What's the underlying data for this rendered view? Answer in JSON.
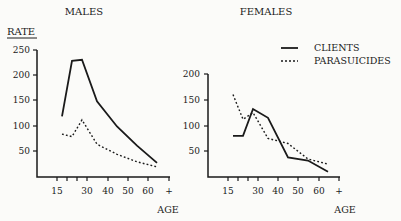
{
  "chart_data": [
    {
      "type": "line",
      "title": "MALES",
      "xlabel": "AGE",
      "ylabel": "RATE",
      "x_tick_labels": [
        "15",
        "30",
        "40",
        "50",
        "60",
        "+"
      ],
      "y_tick_labels": [
        "50",
        "100",
        "150",
        "200",
        "250"
      ],
      "ylim": [
        0,
        250
      ],
      "grid": false,
      "x": [
        17.5,
        22.5,
        27.5,
        35,
        45,
        55,
        65
      ],
      "series": [
        {
          "name": "CLIENTS",
          "style": "solid",
          "values": [
            120,
            230,
            232,
            150,
            100,
            62,
            28
          ]
        },
        {
          "name": "PARASUICIDES",
          "style": "dotted",
          "values": [
            85,
            80,
            113,
            65,
            45,
            30,
            20
          ]
        }
      ]
    },
    {
      "type": "line",
      "title": "FEMALES",
      "xlabel": "AGE",
      "ylabel": "",
      "x_tick_labels": [
        "15",
        "30",
        "40",
        "50",
        "60",
        "+"
      ],
      "y_tick_labels": [
        "50",
        "100",
        "150",
        "200"
      ],
      "ylim": [
        0,
        200
      ],
      "grid": false,
      "x": [
        17.5,
        22.5,
        27.5,
        35,
        45,
        55,
        65
      ],
      "series": [
        {
          "name": "CLIENTS",
          "style": "solid",
          "values": [
            80,
            80,
            132,
            115,
            38,
            32,
            10
          ]
        },
        {
          "name": "PARASUICIDES",
          "style": "dotted",
          "values": [
            160,
            112,
            125,
            75,
            65,
            35,
            25
          ]
        }
      ]
    }
  ],
  "legend": {
    "items": [
      {
        "label": "CLIENTS",
        "style": "solid"
      },
      {
        "label": "PARASUICIDES",
        "style": "dotted"
      }
    ],
    "position": "top-right"
  },
  "labels": {
    "males_title": "MALES",
    "females_title": "FEMALES",
    "rate": "RATE",
    "age": "AGE"
  }
}
